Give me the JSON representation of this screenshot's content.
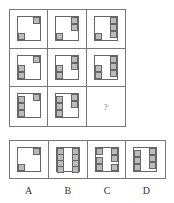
{
  "puzzle": {
    "description": "3x3 figure reasoning matrix with missing bottom-right cell",
    "missing_marker": "?",
    "cells": [
      {
        "row": 1,
        "col": 1,
        "right_squares": 1,
        "left_squares": 1
      },
      {
        "row": 1,
        "col": 2,
        "right_squares": 2,
        "left_squares": 1
      },
      {
        "row": 1,
        "col": 3,
        "right_squares": 3,
        "left_squares": 1
      },
      {
        "row": 2,
        "col": 1,
        "right_squares": 1,
        "left_squares": 2
      },
      {
        "row": 2,
        "col": 2,
        "right_squares": 2,
        "left_squares": 2
      },
      {
        "row": 2,
        "col": 3,
        "right_squares": 3,
        "left_squares": 2
      },
      {
        "row": 3,
        "col": 1,
        "right_squares": 1,
        "left_squares": 3
      },
      {
        "row": 3,
        "col": 2,
        "right_squares": 2,
        "left_squares": 3
      },
      {
        "row": 3,
        "col": 3,
        "missing": true
      }
    ]
  },
  "options": [
    {
      "label": "A",
      "description": "1 square top-right, 1 square bottom-left"
    },
    {
      "label": "B",
      "description": "4 squares stacked left, 4 squares stacked right"
    },
    {
      "label": "C",
      "description": "top-left 1, top-right 2, bottom-left 2, bottom-right 1"
    },
    {
      "label": "D",
      "description": "3 squares top-right, 3 squares bottom-left"
    }
  ],
  "colors": {
    "line": "#777777",
    "square_fill": "#bbbbbb",
    "background": "#ffffff"
  }
}
